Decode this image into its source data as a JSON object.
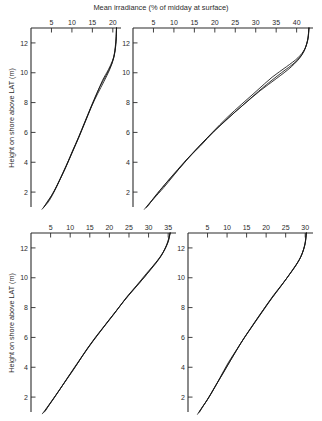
{
  "figure": {
    "suptitle": "Mean  irradiance (% of midday at surface)",
    "ylabel_top": "Height on shore above LAT (m)",
    "ylabel_bottom": "Height on shore above LAT (m)"
  },
  "chart_data": [
    {
      "type": "line",
      "panel": "top-left",
      "title": "Mean  irradiance (% of midday at surface)",
      "xlabel": "Mean irradiance (% of midday at surface)",
      "ylabel": "Height on shore above LAT (m)",
      "xlim": [
        0,
        22
      ],
      "ylim": [
        1,
        13
      ],
      "xticks": [
        5,
        10,
        15,
        20
      ],
      "xtick_labels": [
        "5",
        "10",
        "15",
        "20"
      ],
      "yticks": [
        2,
        4,
        6,
        8,
        10,
        12
      ],
      "ytick_labels": [
        "2",
        "4",
        "6",
        "8",
        "10",
        "12"
      ],
      "grid": false,
      "legend": "none",
      "x_axis_position": "top",
      "series": [
        {
          "name": "curve-left",
          "x": [
            20.9,
            20.8,
            20.5,
            19.9,
            18.9,
            17.5,
            16.1,
            14.6,
            13.1,
            11.6,
            10.0,
            8.4,
            6.8,
            5.3,
            4.1,
            3.3
          ],
          "y": [
            13.0,
            12.2,
            11.4,
            10.8,
            10.2,
            9.5,
            8.6,
            7.6,
            6.6,
            5.6,
            4.6,
            3.6,
            2.7,
            1.9,
            1.4,
            1.05
          ]
        },
        {
          "name": "curve-middle",
          "x": [
            20.9,
            20.8,
            20.4,
            19.6,
            18.3,
            16.9,
            15.4,
            13.9,
            12.4,
            10.9,
            9.3,
            7.8,
            6.3,
            4.9,
            3.8,
            3.0
          ],
          "y": [
            13.0,
            12.1,
            11.2,
            10.5,
            9.8,
            9.1,
            8.2,
            7.2,
            6.2,
            5.2,
            4.2,
            3.3,
            2.4,
            1.7,
            1.25,
            0.95
          ]
        },
        {
          "name": "curve-right",
          "x": [
            20.9,
            20.7,
            20.2,
            19.2,
            17.8,
            16.3,
            14.7,
            13.2,
            11.7,
            10.2,
            8.7,
            7.2,
            5.8,
            4.5,
            3.5,
            2.7
          ],
          "y": [
            13.0,
            12.0,
            11.0,
            10.2,
            9.4,
            8.6,
            7.7,
            6.7,
            5.7,
            4.8,
            3.8,
            2.9,
            2.1,
            1.45,
            1.1,
            0.85
          ]
        }
      ]
    },
    {
      "type": "line",
      "panel": "top-right",
      "title": "Mean  irradiance (% of midday at surface)",
      "xlabel": "Mean irradiance (% of midday at surface)",
      "ylabel": "Height on shore above LAT (m)",
      "xlim": [
        0,
        44
      ],
      "ylim": [
        1,
        13
      ],
      "xticks": [
        5,
        10,
        15,
        20,
        25,
        30,
        35,
        40
      ],
      "xtick_labels": [
        "5",
        "10",
        "15",
        "20",
        "25",
        "30",
        "35",
        "40"
      ],
      "yticks": [
        2,
        4,
        6,
        8,
        10,
        12
      ],
      "ytick_labels": [
        "2",
        "4",
        "6",
        "8",
        "10",
        "12"
      ],
      "grid": false,
      "legend": "none",
      "x_axis_position": "top",
      "series": [
        {
          "name": "curve-left",
          "x": [
            43.0,
            42.8,
            42.0,
            40.3,
            37.5,
            34.0,
            30.3,
            26.6,
            23.0,
            19.4,
            15.9,
            12.5,
            9.3,
            6.6,
            4.7,
            3.6
          ],
          "y": [
            13.0,
            12.3,
            11.6,
            11.0,
            10.4,
            9.7,
            8.8,
            7.9,
            7.0,
            6.0,
            5.0,
            4.0,
            3.0,
            2.1,
            1.45,
            1.05
          ]
        },
        {
          "name": "curve-middle",
          "x": [
            43.0,
            42.7,
            41.7,
            39.6,
            36.3,
            32.6,
            28.8,
            25.1,
            21.5,
            18.0,
            14.6,
            11.4,
            8.4,
            5.9,
            4.2,
            3.2
          ],
          "y": [
            13.0,
            12.2,
            11.4,
            10.7,
            10.0,
            9.2,
            8.3,
            7.4,
            6.5,
            5.6,
            4.6,
            3.6,
            2.7,
            1.9,
            1.3,
            0.95
          ]
        },
        {
          "name": "curve-right",
          "x": [
            43.0,
            42.6,
            41.3,
            38.7,
            35.0,
            31.1,
            27.2,
            23.4,
            19.9,
            16.5,
            13.2,
            10.2,
            7.5,
            5.2,
            3.7,
            2.8
          ],
          "y": [
            13.0,
            12.1,
            11.2,
            10.4,
            9.6,
            8.8,
            7.9,
            7.0,
            6.1,
            5.1,
            4.2,
            3.2,
            2.3,
            1.6,
            1.15,
            0.85
          ]
        }
      ]
    },
    {
      "type": "line",
      "panel": "bottom-left",
      "title": "Mean  irradiance (% of midday at surface)",
      "xlabel": "Mean irradiance (% of midday at surface)",
      "ylabel": "Height on shore above LAT (m)",
      "xlim": [
        0,
        37
      ],
      "ylim": [
        1,
        13
      ],
      "xticks": [
        5,
        10,
        15,
        20,
        25,
        30,
        35
      ],
      "xtick_labels": [
        "5",
        "10",
        "15",
        "20",
        "25",
        "30",
        "35"
      ],
      "yticks": [
        2,
        4,
        6,
        8,
        10,
        12
      ],
      "ytick_labels": [
        "2",
        "4",
        "6",
        "8",
        "10",
        "12"
      ],
      "grid": false,
      "legend": "none",
      "x_axis_position": "top",
      "series": [
        {
          "name": "curve-left",
          "x": [
            35.5,
            35.0,
            33.7,
            31.8,
            29.5,
            27.0,
            24.4,
            21.8,
            19.1,
            16.4,
            13.7,
            11.1,
            8.6,
            6.3,
            4.6,
            3.6
          ],
          "y": [
            13.0,
            12.4,
            11.7,
            11.0,
            10.3,
            9.5,
            8.7,
            7.8,
            6.9,
            6.0,
            5.0,
            4.0,
            3.0,
            2.1,
            1.45,
            1.05
          ]
        },
        {
          "name": "curve-middle",
          "x": [
            35.5,
            34.8,
            33.3,
            31.2,
            28.8,
            26.2,
            23.6,
            21.0,
            18.3,
            15.7,
            13.0,
            10.5,
            8.1,
            5.9,
            4.3,
            3.3
          ],
          "y": [
            13.0,
            12.3,
            11.5,
            10.8,
            10.0,
            9.2,
            8.4,
            7.5,
            6.6,
            5.7,
            4.7,
            3.7,
            2.8,
            1.95,
            1.35,
            0.98
          ]
        },
        {
          "name": "curve-right",
          "x": [
            35.5,
            34.6,
            32.8,
            30.4,
            27.8,
            25.1,
            22.4,
            19.7,
            17.1,
            14.5,
            12.0,
            9.6,
            7.3,
            5.3,
            3.8,
            2.9
          ],
          "y": [
            13.0,
            12.2,
            11.3,
            10.5,
            9.7,
            8.9,
            8.0,
            7.1,
            6.2,
            5.3,
            4.3,
            3.4,
            2.5,
            1.75,
            1.2,
            0.88
          ]
        }
      ]
    },
    {
      "type": "line",
      "panel": "bottom-right",
      "title": "Mean  irradiance (% of midday at surface)",
      "xlabel": "Mean irradiance (% of midday at surface)",
      "ylabel": "Height on shore above LAT (m)",
      "xlim": [
        0,
        32
      ],
      "ylim": [
        1,
        13
      ],
      "xticks": [
        5,
        10,
        15,
        20,
        25,
        30
      ],
      "xtick_labels": [
        "5",
        "10",
        "15",
        "20",
        "25",
        "30"
      ],
      "yticks": [
        2,
        4,
        6,
        8,
        10,
        12
      ],
      "ytick_labels": [
        "2",
        "4",
        "6",
        "8",
        "10",
        "12"
      ],
      "grid": false,
      "legend": "none",
      "x_axis_position": "top",
      "series": [
        {
          "name": "curve-left",
          "x": [
            30.3,
            30.0,
            29.2,
            27.8,
            25.9,
            23.7,
            21.4,
            19.0,
            16.6,
            14.2,
            11.9,
            9.6,
            7.4,
            5.4,
            3.9,
            3.0
          ],
          "y": [
            13.0,
            12.3,
            11.6,
            10.9,
            10.2,
            9.4,
            8.6,
            7.7,
            6.8,
            5.9,
            4.9,
            3.9,
            2.9,
            2.0,
            1.4,
            1.02
          ]
        },
        {
          "name": "curve-middle",
          "x": [
            30.3,
            29.9,
            28.9,
            27.2,
            25.1,
            22.8,
            20.5,
            18.1,
            15.8,
            13.5,
            11.2,
            9.0,
            6.9,
            5.0,
            3.6,
            2.75
          ],
          "y": [
            13.0,
            12.2,
            11.4,
            10.7,
            9.9,
            9.1,
            8.3,
            7.4,
            6.5,
            5.6,
            4.6,
            3.6,
            2.7,
            1.85,
            1.3,
            0.95
          ]
        },
        {
          "name": "curve-right",
          "x": [
            30.3,
            29.8,
            28.5,
            26.5,
            24.2,
            21.8,
            19.4,
            17.0,
            14.7,
            12.5,
            10.3,
            8.2,
            6.3,
            4.5,
            3.2,
            2.45
          ],
          "y": [
            13.0,
            12.1,
            11.2,
            10.4,
            9.6,
            8.8,
            7.9,
            7.0,
            6.1,
            5.2,
            4.3,
            3.3,
            2.4,
            1.65,
            1.15,
            0.85
          ]
        }
      ]
    }
  ]
}
